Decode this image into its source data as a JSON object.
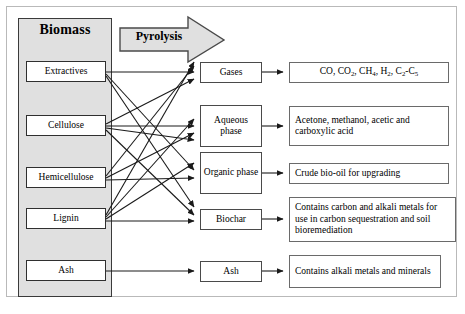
{
  "figure": {
    "biomass_label": "Biomass",
    "process_label": "Pyrolysis",
    "caption_partial": ""
  },
  "colors": {
    "container_fill": "#e0e0e0",
    "arrow_fill": "#e0e0e0",
    "box_fill": "#ffffff",
    "stroke": "#1a1a1a",
    "frame": "#b9b9b9"
  },
  "feedstocks": [
    {
      "id": "extractives",
      "label": "Extractives"
    },
    {
      "id": "cellulose",
      "label": "Cellulose"
    },
    {
      "id": "hemicellulose",
      "label": "Hemicellulose"
    },
    {
      "id": "lignin",
      "label": "Lignin"
    },
    {
      "id": "ash",
      "label": "Ash"
    }
  ],
  "products": [
    {
      "id": "gases",
      "label": "Gases"
    },
    {
      "id": "aqueous",
      "label": "Aqueous phase"
    },
    {
      "id": "organic",
      "label": "Organic phase"
    },
    {
      "id": "biochar",
      "label": "Biochar"
    },
    {
      "id": "ash_product",
      "label": "Ash"
    }
  ],
  "descriptions": [
    {
      "id": "gases_desc",
      "text": "CO, CO2, CH4, H2, C2-C5"
    },
    {
      "id": "aqueous_desc",
      "text": "Acetone, methanol, acetic and carboxylic acid"
    },
    {
      "id": "organic_desc",
      "text": "Crude bio-oil for upgrading"
    },
    {
      "id": "biochar_desc",
      "text": "Contains carbon and alkali metals for use in carbon sequestration and soil bioremediation"
    },
    {
      "id": "ash_desc",
      "text": "Contains alkali metals and minerals"
    }
  ],
  "connections": {
    "note": "Each feedstock maps to multiple pyrolysis products via crossing arrows",
    "edges": [
      {
        "from": "extractives",
        "to": "gases"
      },
      {
        "from": "extractives",
        "to": "organic"
      },
      {
        "from": "extractives",
        "to": "biochar"
      },
      {
        "from": "cellulose",
        "to": "gases"
      },
      {
        "from": "cellulose",
        "to": "aqueous"
      },
      {
        "from": "cellulose",
        "to": "organic"
      },
      {
        "from": "cellulose",
        "to": "biochar"
      },
      {
        "from": "hemicellulose",
        "to": "gases"
      },
      {
        "from": "hemicellulose",
        "to": "aqueous"
      },
      {
        "from": "hemicellulose",
        "to": "organic"
      },
      {
        "from": "lignin",
        "to": "gases"
      },
      {
        "from": "lignin",
        "to": "aqueous"
      },
      {
        "from": "lignin",
        "to": "organic"
      },
      {
        "from": "lignin",
        "to": "biochar"
      },
      {
        "from": "ash",
        "to": "ash_product"
      }
    ]
  }
}
